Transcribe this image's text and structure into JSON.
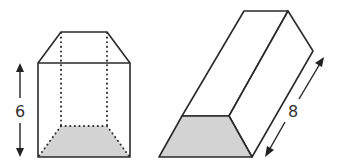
{
  "figures": [
    {
      "name": "trapezoidal-prism-upright",
      "base_shape": "trapezoid",
      "dimension": {
        "label": "6",
        "orientation": "vertical"
      }
    },
    {
      "name": "trapezoidal-prism-slanted",
      "base_shape": "trapezoid",
      "dimension": {
        "label": "8",
        "orientation": "diagonal"
      }
    }
  ],
  "colors": {
    "edge": "#2a2a2a",
    "base_fill": "#d3d3d3",
    "background": "#ffffff"
  }
}
